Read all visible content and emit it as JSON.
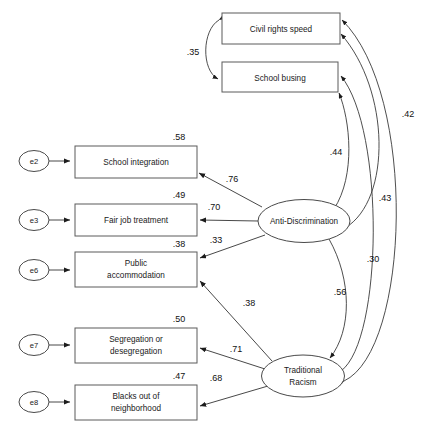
{
  "figure": {
    "type": "sem-path-diagram",
    "title": ""
  },
  "observed": [
    {
      "id": "civil_rights_speed",
      "label": "Civil rights speed",
      "label_line2": "",
      "error_variance": ""
    },
    {
      "id": "school_busing",
      "label": "School busing",
      "label_line2": "",
      "error_variance": ""
    },
    {
      "id": "school_integration",
      "label": "School integration",
      "label_line2": "",
      "error_variance": ".58"
    },
    {
      "id": "fair_job_treatment",
      "label": "Fair job treatment",
      "label_line2": "",
      "error_variance": ".49"
    },
    {
      "id": "public_accommodation",
      "label": "Public",
      "label_line2": "accommodation",
      "error_variance": ".38"
    },
    {
      "id": "segregation_desegregation",
      "label": "Segregation or",
      "label_line2": "desegregation",
      "error_variance": ".50"
    },
    {
      "id": "blacks_out_of_neighborhood",
      "label": "Blacks out of",
      "label_line2": "neighborhood",
      "error_variance": ".47"
    }
  ],
  "latents": [
    {
      "id": "anti_discrimination",
      "label": "Anti-Discrimination",
      "label_line2": ""
    },
    {
      "id": "traditional_racism",
      "label": "Traditional",
      "label_line2": "Racism"
    }
  ],
  "errors": [
    {
      "id": "e2",
      "label": "e2",
      "target": "school_integration"
    },
    {
      "id": "e3",
      "label": "e3",
      "target": "fair_job_treatment"
    },
    {
      "id": "e6",
      "label": "e6",
      "target": "public_accommodation"
    },
    {
      "id": "e7",
      "label": "e7",
      "target": "segregation_desegregation"
    },
    {
      "id": "e8",
      "label": "e8",
      "target": "blacks_out_of_neighborhood"
    }
  ],
  "paths": [
    {
      "id": "p_corr_top",
      "from": "civil_rights_speed",
      "to": "school_busing",
      "coefficient": ".35",
      "kind": "covariance"
    },
    {
      "id": "p_ad_si",
      "from": "anti_discrimination",
      "to": "school_integration",
      "coefficient": ".76",
      "kind": "loading"
    },
    {
      "id": "p_ad_fj",
      "from": "anti_discrimination",
      "to": "fair_job_treatment",
      "coefficient": ".70",
      "kind": "loading"
    },
    {
      "id": "p_ad_pa",
      "from": "anti_discrimination",
      "to": "public_accommodation",
      "coefficient": ".33",
      "kind": "loading"
    },
    {
      "id": "p_tr_pa",
      "from": "traditional_racism",
      "to": "public_accommodation",
      "coefficient": ".38",
      "kind": "loading"
    },
    {
      "id": "p_tr_sd",
      "from": "traditional_racism",
      "to": "segregation_desegregation",
      "coefficient": ".71",
      "kind": "loading"
    },
    {
      "id": "p_tr_bn",
      "from": "traditional_racism",
      "to": "blacks_out_of_neighborhood",
      "coefficient": ".68",
      "kind": "loading"
    },
    {
      "id": "p_ad_sb",
      "from": "anti_discrimination",
      "to": "school_busing",
      "coefficient": ".44",
      "kind": "structural"
    },
    {
      "id": "p_tr_ad",
      "from": "traditional_racism",
      "to": "anti_discrimination",
      "coefficient": ".56",
      "kind": "covariance"
    },
    {
      "id": "p_ad_crs",
      "from": "anti_discrimination",
      "to": "civil_rights_speed",
      "coefficient": ".43",
      "kind": "structural"
    },
    {
      "id": "p_tr_crs",
      "from": "traditional_racism",
      "to": "civil_rights_speed",
      "coefficient": ".42",
      "kind": "structural"
    },
    {
      "id": "p_tr_sb",
      "from": "traditional_racism",
      "to": "school_busing",
      "coefficient": ".30",
      "kind": "structural"
    }
  ]
}
